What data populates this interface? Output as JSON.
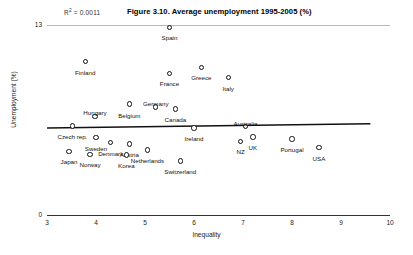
{
  "figure": {
    "title": "Figure 3.10. Average unemployment 1995-2005 (%)",
    "r2_prefix": "R",
    "r2_sup": "2",
    "r2_value": " = 0.0011"
  },
  "chart_data": {
    "type": "scatter",
    "title": "Figure 3.10. Average unemployment 1995-2005 (%)",
    "xlabel": "Inequality",
    "ylabel": "Unemployment (%)",
    "xlim": [
      3,
      10
    ],
    "ylim": [
      0,
      13
    ],
    "xticks": [
      "3",
      "4",
      "5",
      "6",
      "7",
      "8",
      "9",
      "10"
    ],
    "yticks": [
      "0",
      "13"
    ],
    "grid": "top-only",
    "legend": "none",
    "annotations": [
      {
        "name": "r-squared",
        "text": "R² = 0.0011",
        "value": 0.0011
      }
    ],
    "trendline": {
      "type": "linear",
      "x_start": 3.0,
      "y_start": 5.95,
      "x_end": 9.6,
      "y_end": 6.25,
      "r_squared": 0.0011
    },
    "points": [
      {
        "label": "Spain",
        "x": 5.5,
        "y": 12.85,
        "label_dx": 0,
        "label_dy": 8
      },
      {
        "label": "Finland",
        "x": 3.78,
        "y": 10.5,
        "label_dx": 0,
        "label_dy": 8
      },
      {
        "label": "France",
        "x": 5.5,
        "y": 9.7,
        "label_dx": 0,
        "label_dy": 8
      },
      {
        "label": "Greece",
        "x": 6.15,
        "y": 10.1,
        "label_dx": 0,
        "label_dy": 8
      },
      {
        "label": "Italy",
        "x": 6.7,
        "y": 9.4,
        "label_dx": 0,
        "label_dy": 8
      },
      {
        "label": "Germany",
        "x": 5.22,
        "y": 7.4,
        "label_dx": 0,
        "label_dy": -6
      },
      {
        "label": "Belgium",
        "x": 4.68,
        "y": 7.6,
        "label_dx": 0,
        "label_dy": 9
      },
      {
        "label": "Canada",
        "x": 5.62,
        "y": 7.25,
        "label_dx": 0,
        "label_dy": 8
      },
      {
        "label": "Hungary",
        "x": 3.98,
        "y": 6.75,
        "label_dx": 0,
        "label_dy": -6
      },
      {
        "label": "Czech rep.",
        "x": 3.52,
        "y": 6.1,
        "label_dx": 0,
        "label_dy": 8
      },
      {
        "label": "Ireland",
        "x": 6.0,
        "y": 5.95,
        "label_dx": 0,
        "label_dy": 8
      },
      {
        "label": "Australia",
        "x": 7.05,
        "y": 6.05,
        "label_dx": 0,
        "label_dy": -6
      },
      {
        "label": "Sweden",
        "x": 4.0,
        "y": 5.3,
        "label_dx": 0,
        "label_dy": 8
      },
      {
        "label": "Denmark",
        "x": 4.3,
        "y": 4.95,
        "label_dx": 0,
        "label_dy": 8
      },
      {
        "label": "Austria",
        "x": 4.68,
        "y": 4.85,
        "label_dx": 0,
        "label_dy": 8
      },
      {
        "label": "NZ",
        "x": 6.95,
        "y": 5.05,
        "label_dx": 0,
        "label_dy": 8
      },
      {
        "label": "UK",
        "x": 7.2,
        "y": 5.35,
        "label_dx": 0,
        "label_dy": 8
      },
      {
        "label": "Portugal",
        "x": 8.0,
        "y": 5.2,
        "label_dx": 0,
        "label_dy": 8
      },
      {
        "label": "USA",
        "x": 8.55,
        "y": 4.6,
        "label_dx": 0,
        "label_dy": 8
      },
      {
        "label": "Japan",
        "x": 3.45,
        "y": 4.35,
        "label_dx": 0,
        "label_dy": 8
      },
      {
        "label": "Norway",
        "x": 3.88,
        "y": 4.15,
        "label_dx": 0,
        "label_dy": 8
      },
      {
        "label": "Korea",
        "x": 4.62,
        "y": 4.1,
        "label_dx": 0,
        "label_dy": 8
      },
      {
        "label": "Netherlands",
        "x": 5.05,
        "y": 4.45,
        "label_dx": 0,
        "label_dy": 8
      },
      {
        "label": "Switzerland",
        "x": 5.72,
        "y": 3.7,
        "label_dx": 0,
        "label_dy": 8
      }
    ]
  }
}
